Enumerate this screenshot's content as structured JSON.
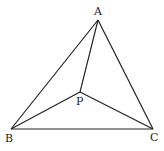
{
  "diagram": {
    "type": "geometry-triangle",
    "points": {
      "A": {
        "label": "A",
        "x": 98,
        "y": 20
      },
      "B": {
        "label": "B",
        "x": 11,
        "y": 129
      },
      "C": {
        "label": "C",
        "x": 153,
        "y": 129
      },
      "P": {
        "label": "P",
        "x": 80,
        "y": 92
      }
    },
    "segments": [
      [
        "A",
        "B"
      ],
      [
        "B",
        "C"
      ],
      [
        "C",
        "A"
      ],
      [
        "P",
        "A"
      ],
      [
        "P",
        "B"
      ],
      [
        "P",
        "C"
      ]
    ],
    "line_color": "#222222"
  }
}
